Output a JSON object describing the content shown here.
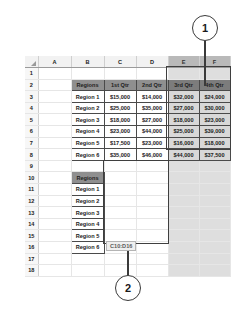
{
  "worksheet": {
    "column_headers": [
      "A",
      "B",
      "C",
      "D",
      "E",
      "F"
    ],
    "selected_columns": [
      "E",
      "F"
    ],
    "row_numbers": [
      "1",
      "2",
      "3",
      "4",
      "5",
      "6",
      "7",
      "8",
      "9",
      "10",
      "11",
      "12",
      "13",
      "14",
      "15",
      "16",
      "17",
      "18"
    ]
  },
  "upper_table": {
    "headers": [
      "Regions",
      "1st Qtr",
      "2nd Qtr",
      "3rd Qtr",
      "4th Qtr"
    ],
    "rows": [
      {
        "label": "Region 1",
        "values": [
          "$15,000",
          "$14,000",
          "$32,000",
          "$24,000"
        ]
      },
      {
        "label": "Region 2",
        "values": [
          "$25,000",
          "$35,000",
          "$27,000",
          "$30,000"
        ]
      },
      {
        "label": "Region 3",
        "values": [
          "$18,000",
          "$27,000",
          "$18,000",
          "$23,000"
        ]
      },
      {
        "label": "Region 4",
        "values": [
          "$23,000",
          "$44,000",
          "$25,000",
          "$39,000"
        ]
      },
      {
        "label": "Region 5",
        "values": [
          "$17,500",
          "$23,000",
          "$16,000",
          "$18,000"
        ]
      },
      {
        "label": "Region 6",
        "values": [
          "$35,000",
          "$46,000",
          "$44,000",
          "$37,500"
        ]
      }
    ]
  },
  "lower_table": {
    "headers": [
      "Regions"
    ],
    "rows": [
      {
        "label": "Region 1"
      },
      {
        "label": "Region 2"
      },
      {
        "label": "Region 3"
      },
      {
        "label": "Region 4"
      },
      {
        "label": "Region 5"
      },
      {
        "label": "Region 6"
      }
    ]
  },
  "selection": {
    "range_tooltip": "C10:D16"
  },
  "callouts": [
    {
      "number": "1"
    },
    {
      "number": "2"
    }
  ],
  "colors": {
    "header_fill": "#8f8f8f",
    "selection_tint": "#d8d8d8",
    "outline": "#3f3f3f"
  }
}
